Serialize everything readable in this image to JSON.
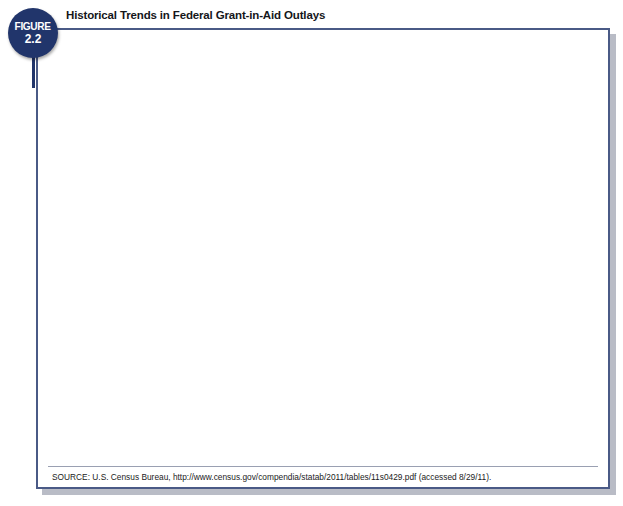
{
  "figure": {
    "badge_word": "FIGURE",
    "badge_number": "2.2",
    "title": "Historical Trends in Federal Grant-in-Aid Outlays",
    "source": "SOURCE: U.S. Census Bureau, http://www.census.gov/compendia/statab/2011/tables/11s0429.pdf (accessed 8/29/11)."
  },
  "colors": {
    "frame_border": "#4a5a86",
    "badge": "#21356b",
    "plot_background": "#ebe4c4",
    "purple_bar": "#8286b8",
    "green_bar": "#9bbd9a",
    "brown_bar": "#a2573b"
  },
  "chart_data": [
    {
      "type": "bar",
      "id": "left-chart",
      "title": "",
      "xlabel": "Year",
      "ylabel": "Billions of Dollars",
      "categories": [
        "1990",
        "1995",
        "2000",
        "2005",
        "2010"
      ],
      "ylim": [
        0,
        700
      ],
      "yticks": [
        0,
        50,
        100,
        150,
        200,
        250,
        300,
        350,
        400,
        450,
        500,
        550,
        600,
        650,
        700
      ],
      "grid": true,
      "legend_position": "bottom",
      "series": [
        {
          "name": "Total Grant-in-Aid Outlays",
          "color": "#8286b8",
          "values": [
            135,
            220,
            285,
            420,
            655
          ]
        }
      ]
    },
    {
      "type": "bar",
      "id": "right-chart",
      "title": "",
      "xlabel": "",
      "ylabel": "Federal Grants to State and Local Governments",
      "categories": [
        "1990",
        "1995",
        "2000",
        "2005",
        "2010"
      ],
      "ylim": [
        0,
        40
      ],
      "yticks": [
        0,
        5,
        10,
        15,
        20,
        25,
        30,
        35,
        40
      ],
      "grid": true,
      "legend_position": "bottom",
      "series": [
        {
          "name": "Federal Grants as a Percentage of State\nand Local Expenditures",
          "color": "#9bbd9a",
          "values": [
            25.2,
            31.5,
            27.3,
            30.9,
            37.6
          ]
        },
        {
          "name": "Federal Grants as a Percentage\nof Total Federal Outlays",
          "color": "#a2573b",
          "values": [
            10.8,
            14.9,
            16.0,
            17.4,
            17.7
          ]
        }
      ]
    }
  ]
}
